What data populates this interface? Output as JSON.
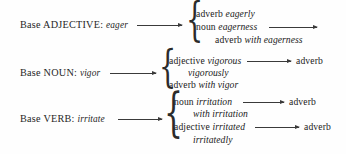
{
  "figure": {
    "kind": "derivation-diagram",
    "ink_color": "#222222",
    "background_color": "#fefefe"
  },
  "rows": [
    {
      "id": "adjective",
      "base_prefix": "Base ADJECTIVE:",
      "base_word": "eager",
      "branches": [
        {
          "pos": "adverb",
          "form": "eagerly",
          "has_arrow": false,
          "result": ""
        },
        {
          "pos": "noun",
          "form": "eagerness",
          "has_arrow": true,
          "result": ""
        },
        {
          "pos": "adverb",
          "form": "with eagerness",
          "has_arrow": false,
          "result": ""
        }
      ]
    },
    {
      "id": "noun",
      "base_prefix": "Base NOUN:",
      "base_word": "vigor",
      "branches": [
        {
          "pos": "adjective",
          "form": "vigorous",
          "has_arrow": true,
          "result": "adverb"
        },
        {
          "pos": "",
          "form": "vigorously",
          "has_arrow": false,
          "result": ""
        },
        {
          "pos": "adverb",
          "form": "with vigor",
          "has_arrow": false,
          "result": ""
        }
      ]
    },
    {
      "id": "verb",
      "base_prefix": "Base VERB:",
      "base_word": "irritate",
      "branches": [
        {
          "pos": "noun",
          "form": "irritation",
          "has_arrow": true,
          "result": "adverb"
        },
        {
          "pos": "",
          "form": "with irritation",
          "has_arrow": false,
          "result": ""
        },
        {
          "pos": "adjective",
          "form": "irritated",
          "has_arrow": true,
          "result": "adverb"
        },
        {
          "pos": "",
          "form": "irritatedly",
          "has_arrow": false,
          "result": ""
        }
      ]
    }
  ],
  "braces": {
    "glyph": "{"
  }
}
